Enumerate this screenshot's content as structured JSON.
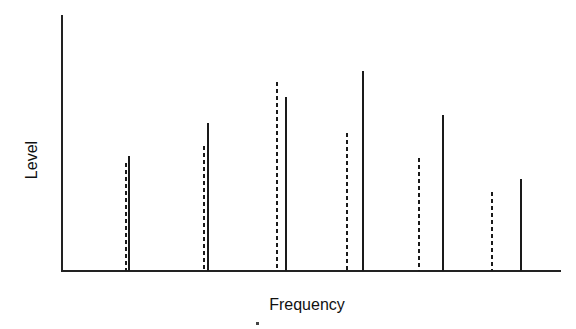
{
  "chart_data": {
    "type": "bar",
    "subtype": "line-spectrum",
    "title": "",
    "xlabel": "Frequency",
    "ylabel": "Level",
    "ylim": [
      0,
      100
    ],
    "grid": false,
    "legend": null,
    "ticks": {
      "x": [],
      "y": []
    },
    "categories": [
      "1",
      "2",
      "3",
      "4",
      "5",
      "6"
    ],
    "series": [
      {
        "name": "dashed",
        "style": "dashed",
        "x_px": [
          126,
          204,
          277,
          347,
          419,
          492
        ],
        "values": [
          42,
          49,
          74,
          54,
          44,
          31
        ]
      },
      {
        "name": "solid",
        "style": "solid",
        "x_px": [
          129,
          208,
          286,
          363,
          443,
          521
        ],
        "values": [
          45,
          58,
          68,
          78,
          61,
          36
        ]
      }
    ]
  },
  "axes": {
    "x_label": "Frequency",
    "y_label": "Level"
  }
}
